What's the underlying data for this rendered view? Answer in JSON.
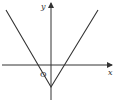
{
  "diagram": {
    "type": "function-graph",
    "axes": {
      "x_label": "x",
      "y_label": "y",
      "origin_label": "O"
    },
    "colors": {
      "line": "#333333",
      "background": "#ffffff"
    }
  }
}
